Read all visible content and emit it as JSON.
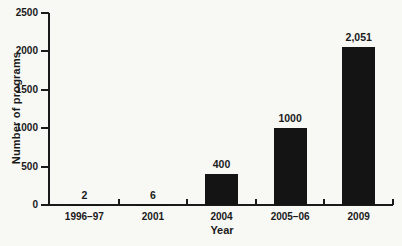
{
  "chart_data": {
    "type": "bar",
    "categories": [
      "1996–97",
      "2001",
      "2004",
      "2005–06",
      "2009"
    ],
    "values": [
      2,
      6,
      400,
      1000,
      2051
    ],
    "bar_labels": [
      "2",
      "6",
      "400",
      "1000",
      "2,051"
    ],
    "title": "",
    "xlabel": "Year",
    "ylabel": "Number of programs",
    "ylim": [
      0,
      2500
    ],
    "yticks": [
      0,
      500,
      1000,
      1500,
      2000,
      2500
    ],
    "grid": false,
    "legend": false,
    "bar_color": "#141414",
    "axis_color": "#1a1a1a",
    "text_color": "#1a1a1a",
    "background": "#f8f8f5"
  }
}
